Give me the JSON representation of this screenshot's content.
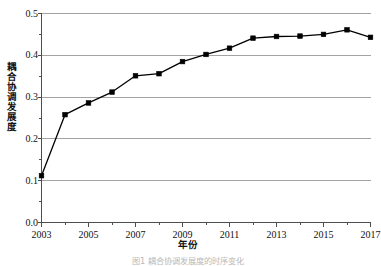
{
  "figure": {
    "background": "#ffffff",
    "caption": "图1    耦合协调发展度的时序变化"
  },
  "chart_data": {
    "type": "line",
    "title": "",
    "xlabel": "年份",
    "ylabel": "耦合协调发展度",
    "x": [
      2003,
      2004,
      2005,
      2006,
      2007,
      2008,
      2009,
      2010,
      2011,
      2012,
      2013,
      2014,
      2015,
      2016,
      2017
    ],
    "values": [
      0.112,
      0.258,
      0.286,
      0.312,
      0.351,
      0.356,
      0.385,
      0.402,
      0.417,
      0.441,
      0.445,
      0.446,
      0.45,
      0.461,
      0.443
    ],
    "series": [
      {
        "name": "耦合协调发展度",
        "values": [
          0.112,
          0.258,
          0.286,
          0.312,
          0.351,
          0.356,
          0.385,
          0.402,
          0.417,
          0.441,
          0.445,
          0.446,
          0.45,
          0.461,
          0.443
        ],
        "line_color": "#000000",
        "marker": "square",
        "marker_color": "#000000"
      }
    ],
    "xlim": [
      2003,
      2017
    ],
    "ylim": [
      0.0,
      0.5
    ],
    "yticks": [
      "0.0",
      "0.1",
      "0.2",
      "0.3",
      "0.4",
      "0.5"
    ],
    "ytick_values": [
      0.0,
      0.1,
      0.2,
      0.3,
      0.4,
      0.5
    ],
    "y_minor_tick_step": 0.05,
    "xticks": [
      "2003",
      "2005",
      "2007",
      "2009",
      "2011",
      "2013",
      "2015",
      "2017"
    ],
    "xtick_values": [
      2003,
      2005,
      2007,
      2009,
      2011,
      2013,
      2015,
      2017
    ],
    "grid": "horizontal",
    "grid_color": "#8c8c8c",
    "legend": "none",
    "axis_color": "#4d4d4d"
  }
}
